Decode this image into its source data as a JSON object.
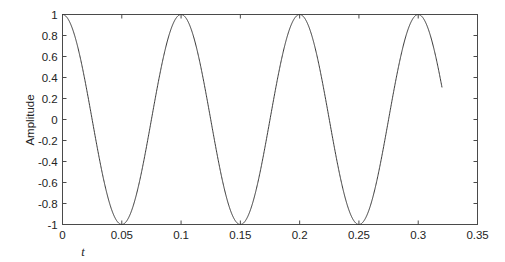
{
  "chart_data": {
    "type": "line",
    "title": "",
    "xlabel": "t",
    "ylabel": "Amplitude",
    "xlim": [
      0,
      0.35
    ],
    "ylim": [
      -1,
      1
    ],
    "grid": false,
    "legend": null,
    "xticks": [
      "0",
      "0.05",
      "0.1",
      "0.15",
      "0.2",
      "0.25",
      "0.3",
      "0.35"
    ],
    "xtick_values": [
      0,
      0.05,
      0.1,
      0.15,
      0.2,
      0.25,
      0.3,
      0.35
    ],
    "yticks": [
      "1",
      "0.8",
      "0.6",
      "0.4",
      "0.2",
      "0",
      "-0.2",
      "-0.4",
      "-0.6",
      "-0.8",
      "-1"
    ],
    "ytick_values": [
      1,
      0.8,
      0.6,
      0.4,
      0.2,
      0,
      -0.2,
      -0.4,
      -0.6,
      -0.8,
      -1
    ],
    "series": [
      {
        "name": "cosine",
        "color": "#3a3a3a",
        "line_width": 1,
        "description": "Amplitude 1 cosine wave, frequency 10 Hz, starting at a maximum at t = 0 and truncated at t = 0.32",
        "amplitude": 1,
        "frequency_hz": 10,
        "phase": 0,
        "t_start": 0,
        "t_end": 0.32,
        "maxima_t": [
          0,
          0.1,
          0.2,
          0.3
        ],
        "minima_t": [
          0.05,
          0.15,
          0.25
        ],
        "zero_crossings_t": [
          0.025,
          0.075,
          0.125,
          0.175,
          0.225,
          0.275
        ],
        "end_value": 0.31
      }
    ],
    "axes_color": "#4a4a4a"
  }
}
